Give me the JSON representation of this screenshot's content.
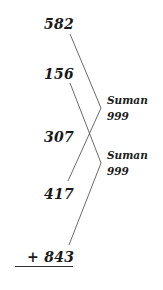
{
  "numbers": [
    {
      "value": "582"
    },
    {
      "value": "156"
    },
    {
      "value": "307"
    },
    {
      "value": "417"
    },
    {
      "value": "+ 843"
    }
  ],
  "labels": [
    {
      "name": "Suman",
      "value": "999"
    },
    {
      "name": "Suman",
      "value": "999"
    }
  ],
  "colors": {
    "text": "#1a1a1a",
    "line": "#444444"
  }
}
